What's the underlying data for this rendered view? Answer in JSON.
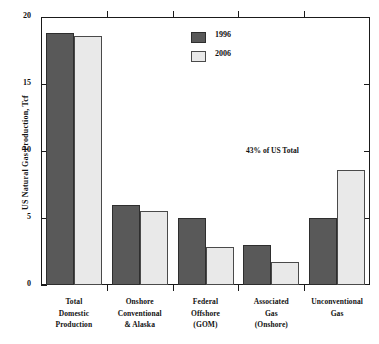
{
  "chart_data": {
    "type": "bar",
    "title": "",
    "subtitle": "",
    "xlabel": "",
    "ylabel": "US Natural Gas Production, Tcf",
    "ylim": [
      0,
      20
    ],
    "yticks": [
      0,
      5,
      10,
      15,
      20
    ],
    "ytick_labels": [
      "0",
      "5",
      "10",
      "15",
      "20"
    ],
    "grid": false,
    "legend_position": "top-center",
    "categories": [
      "Total Domestic Production",
      "Onshore Conventional & Alaska",
      "Federal Offshore (GOM)",
      "Associated Gas (Onshore)",
      "Unconventional Gas"
    ],
    "category_label_lines": [
      [
        "Total",
        "Domestic",
        "Production"
      ],
      [
        "Onshore",
        "Conventional",
        "& Alaska"
      ],
      [
        "Federal",
        "Offshore",
        "(GOM)"
      ],
      [
        "Associated",
        "Gas",
        "(Onshore)"
      ],
      [
        "Unconventional",
        "Gas"
      ]
    ],
    "series": [
      {
        "name": "1996",
        "color": "#595959",
        "values": [
          18.8,
          6.0,
          5.0,
          3.0,
          5.0
        ]
      },
      {
        "name": "2006",
        "color": "#e9e9e9",
        "values": [
          18.6,
          5.5,
          2.8,
          1.7,
          8.6
        ]
      }
    ],
    "annotations": [
      {
        "text": "43% of US Total",
        "category": "Unconventional Gas",
        "series": "2006",
        "value": 8.6
      }
    ]
  },
  "legend": {
    "items": [
      {
        "label": "1996"
      },
      {
        "label": "2006"
      }
    ]
  }
}
